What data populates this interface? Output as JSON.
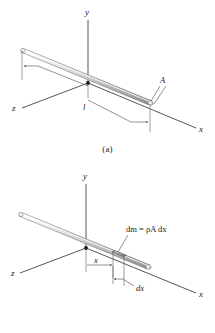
{
  "figure": {
    "panels": [
      {
        "id": "a",
        "caption": "(a)",
        "axes": {
          "x": "x",
          "y": "y",
          "z": "z"
        },
        "labels": {
          "length": "l",
          "area": "A"
        },
        "description": "Uniform slender rod of length l lying along the x axis with cross-sectional area A at the far end."
      },
      {
        "id": "b",
        "caption": "(b)",
        "axes": {
          "x": "x",
          "y": "y",
          "z": "z"
        },
        "labels": {
          "distance": "x",
          "element_width": "dx",
          "mass_equation": "dm = ρA dx"
        },
        "description": "Same rod showing a differential element of width dx located a distance x from the origin, with mass dm = rho A dx."
      }
    ],
    "colors": {
      "background": "#ffffff",
      "ink": "#1a1a1a",
      "line": "#2b2b2b",
      "rod_light": "#f2f2f2",
      "rod_mid": "#c9c9c9",
      "rod_dark": "#8d8d8d",
      "element_fill": "#9a9a9a"
    }
  }
}
